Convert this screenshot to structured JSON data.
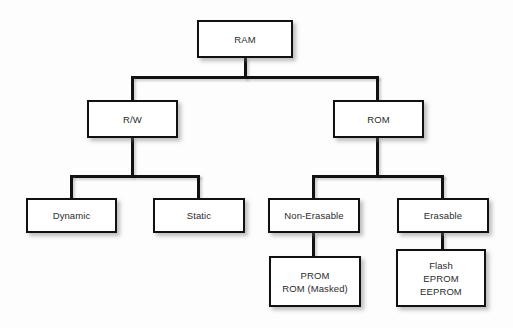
{
  "diagram": {
    "type": "tree",
    "background_color": "#fdfdfd",
    "box_fill_color": "#ffffff",
    "box_border_color": "#111111",
    "line_color": "#111111",
    "text_color": "#2b2b2b",
    "nodes": [
      {
        "id": "ram",
        "label": "RAM",
        "level": 0,
        "x": 197,
        "y": 20,
        "w": 96,
        "h": 38
      },
      {
        "id": "rw",
        "label": "R/W",
        "level": 1,
        "x": 87,
        "y": 100,
        "w": 91,
        "h": 38
      },
      {
        "id": "rom",
        "label": "ROM",
        "level": 1,
        "x": 333,
        "y": 100,
        "w": 91,
        "h": 38
      },
      {
        "id": "dynamic",
        "label": "Dynamic",
        "level": 2,
        "x": 26,
        "y": 198,
        "w": 91,
        "h": 35
      },
      {
        "id": "static",
        "label": "Static",
        "level": 2,
        "x": 153,
        "y": 198,
        "w": 92,
        "h": 35
      },
      {
        "id": "non-erasable",
        "label": "Non-Erasable",
        "level": 2,
        "x": 268,
        "y": 198,
        "w": 92,
        "h": 35
      },
      {
        "id": "erasable",
        "label": "Erasable",
        "level": 2,
        "x": 397,
        "y": 198,
        "w": 92,
        "h": 35
      },
      {
        "id": "prom",
        "label": "PROM\nROM (Masked)",
        "level": 3,
        "x": 269,
        "y": 256,
        "w": 92,
        "h": 51
      },
      {
        "id": "flash",
        "label": "Flash\nEPROM\nEEPROM",
        "level": 3,
        "x": 396,
        "y": 249,
        "w": 90,
        "h": 58
      }
    ],
    "edges": [
      {
        "from": "ram",
        "to": "rw",
        "label": ""
      },
      {
        "from": "ram",
        "to": "rom",
        "label": ""
      },
      {
        "from": "rw",
        "to": "dynamic",
        "label": ""
      },
      {
        "from": "rw",
        "to": "static",
        "label": ""
      },
      {
        "from": "rom",
        "to": "non-erasable",
        "label": ""
      },
      {
        "from": "rom",
        "to": "erasable",
        "label": ""
      },
      {
        "from": "non-erasable",
        "to": "prom",
        "label": ""
      },
      {
        "from": "erasable",
        "to": "flash",
        "label": ""
      }
    ],
    "connectors": [
      {
        "id": "ram-stem",
        "orient": "v",
        "x": 244,
        "y": 58,
        "len": 21
      },
      {
        "id": "ram-bus",
        "orient": "h",
        "x": 131,
        "y": 76,
        "len": 248
      },
      {
        "id": "ram-to-rw-drop",
        "orient": "v",
        "x": 131,
        "y": 76,
        "len": 25
      },
      {
        "id": "ram-to-rom-drop",
        "orient": "v",
        "x": 376,
        "y": 76,
        "len": 25
      },
      {
        "id": "rw-stem",
        "orient": "v",
        "x": 131,
        "y": 138,
        "len": 39
      },
      {
        "id": "rw-bus",
        "orient": "h",
        "x": 70,
        "y": 175,
        "len": 130
      },
      {
        "id": "rw-to-dyn-drop",
        "orient": "v",
        "x": 70,
        "y": 175,
        "len": 24
      },
      {
        "id": "rw-to-sta-drop",
        "orient": "v",
        "x": 197,
        "y": 175,
        "len": 24
      },
      {
        "id": "rom-stem",
        "orient": "v",
        "x": 376,
        "y": 138,
        "len": 39
      },
      {
        "id": "rom-bus",
        "orient": "h",
        "x": 312,
        "y": 175,
        "len": 132
      },
      {
        "id": "rom-to-ne-drop",
        "orient": "v",
        "x": 312,
        "y": 175,
        "len": 24
      },
      {
        "id": "rom-to-er-drop",
        "orient": "v",
        "x": 441,
        "y": 175,
        "len": 24
      },
      {
        "id": "ne-to-prom",
        "orient": "v",
        "x": 312,
        "y": 233,
        "len": 24
      },
      {
        "id": "er-to-flash",
        "orient": "v",
        "x": 441,
        "y": 233,
        "len": 17
      }
    ]
  }
}
